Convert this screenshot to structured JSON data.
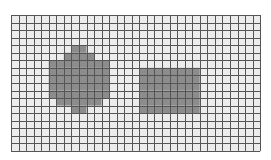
{
  "grid": {
    "cols": 33,
    "rows": 18,
    "cell_size": 7.55,
    "origin_x": 11,
    "origin_y": 15,
    "colors": {
      "empty": "#ececec",
      "filled": "#8c8c8c",
      "line": "#555555"
    }
  },
  "shapes": [
    {
      "name": "diamond-blob",
      "rows": [
        {
          "row": 4,
          "from": 8,
          "to": 9
        },
        {
          "row": 5,
          "from": 7,
          "to": 10
        },
        {
          "row": 6,
          "from": 5,
          "to": 12
        },
        {
          "row": 7,
          "from": 5,
          "to": 12
        },
        {
          "row": 8,
          "from": 5,
          "to": 12
        },
        {
          "row": 9,
          "from": 5,
          "to": 12
        },
        {
          "row": 10,
          "from": 5,
          "to": 12
        },
        {
          "row": 11,
          "from": 6,
          "to": 11
        },
        {
          "row": 12,
          "from": 8,
          "to": 9
        }
      ]
    },
    {
      "name": "rectangle",
      "rows": [
        {
          "row": 7,
          "from": 17,
          "to": 24
        },
        {
          "row": 8,
          "from": 17,
          "to": 24
        },
        {
          "row": 9,
          "from": 17,
          "to": 24
        },
        {
          "row": 10,
          "from": 17,
          "to": 24
        },
        {
          "row": 11,
          "from": 17,
          "to": 24
        },
        {
          "row": 12,
          "from": 17,
          "to": 24
        }
      ]
    }
  ]
}
